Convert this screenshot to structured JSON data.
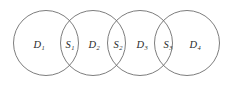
{
  "figure": {
    "name": "overlapping-circles-venn-chain",
    "background_color": "#ffffff",
    "width": 238,
    "height": 88
  },
  "style": {
    "circle_stroke_color": "#6e6e6e",
    "circle_stroke_width": 0.9,
    "circle_fill": "none",
    "label_color": "#2b2b2b"
  },
  "circles": [
    {
      "id": "circle-1",
      "cx": 46,
      "cy": 43,
      "r": 32.5
    },
    {
      "id": "circle-2",
      "cx": 93,
      "cy": 43,
      "r": 32.5
    },
    {
      "id": "circle-3",
      "cx": 140,
      "cy": 43,
      "r": 32.5
    },
    {
      "id": "circle-4",
      "cx": 187,
      "cy": 43,
      "r": 32.5
    }
  ],
  "labels": [
    {
      "id": "label-d1",
      "base": "D",
      "sub": "1",
      "x": 39,
      "y": 45
    },
    {
      "id": "label-s1",
      "base": "S",
      "sub": "1",
      "x": 70,
      "y": 45
    },
    {
      "id": "label-d2",
      "base": "D",
      "sub": "2",
      "x": 94,
      "y": 45
    },
    {
      "id": "label-s2",
      "base": "S",
      "sub": "2",
      "x": 118,
      "y": 45
    },
    {
      "id": "label-d3",
      "base": "D",
      "sub": "3",
      "x": 142,
      "y": 45
    },
    {
      "id": "label-s3",
      "base": "S",
      "sub": "3",
      "x": 168,
      "y": 45
    },
    {
      "id": "label-d4",
      "base": "D",
      "sub": "4",
      "x": 195,
      "y": 45
    }
  ]
}
